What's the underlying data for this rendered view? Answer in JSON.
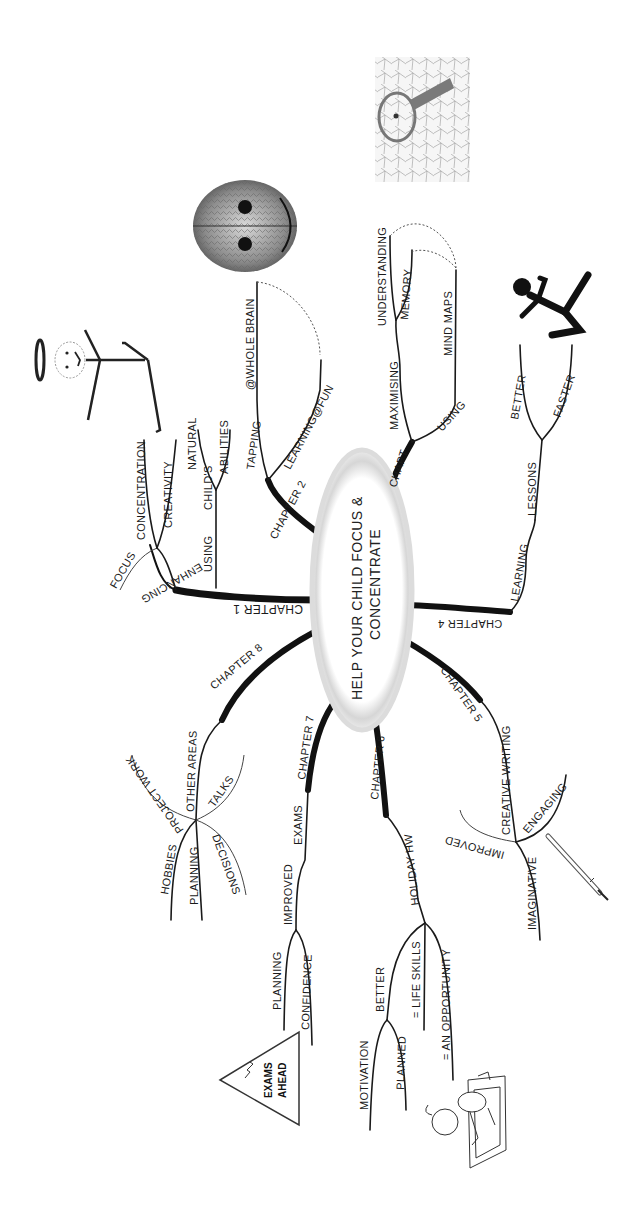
{
  "title": "HELP YOUR CHILD FOCUS & CONCENTRATE",
  "center": {
    "line1": "HELP YOUR CHILD FOCUS &",
    "line2": "CONCENTRATE"
  },
  "orientation": "rotated 90° counter-clockwise",
  "branches": {
    "chapter1": {
      "label": "CHAPTER 1",
      "enhancing": "ENHANCING",
      "focus": "FOCUS",
      "concentration": "CONCENTRATION",
      "creativity": "CREATIVITY",
      "using": "USING",
      "childs": "CHILD'S",
      "natural": "NATURAL",
      "abilities": "ABILITIES"
    },
    "chapter2": {
      "label": "CHAPTER 2",
      "tapping": "TAPPING",
      "whole_brain": "@WHOLE BRAIN",
      "learning_fun": "LEARNING@FUN"
    },
    "chapter3": {
      "label": "CHAPT",
      "maximising": "MAXIMISING",
      "understanding": "UNDERSTANDING",
      "memory": "MEMORY",
      "using": "USING",
      "mind_maps": "MIND MAPS"
    },
    "chapter4": {
      "label": "CHAPTER 4",
      "learning": "LEARNING",
      "lessons": "LESSONS",
      "better": "BETTER",
      "faster": "FASTER"
    },
    "chapter5": {
      "label": "CHAPTER 5",
      "creative_writing": "CREATIVE WRITING",
      "improved": "IMPROVED",
      "engaging": "ENGAGING",
      "imaginative": "IMAGINATIVE"
    },
    "chapter6": {
      "label": "CHAPTER 6",
      "holiday_hw": "HOLIDAY HW",
      "better": "BETTER",
      "motivation": "MOTIVATION",
      "planned": "PLANNED",
      "life_skills": "= LIFE SKILLS",
      "opportunity": "= AN OPPORTUNITY"
    },
    "chapter7": {
      "label": "CHAPTER 7",
      "exams": "EXAMS",
      "improved": "IMPROVED",
      "planning": "PLANNING",
      "confidence": "CONFIDENCE"
    },
    "chapter8": {
      "label": "CHAPTER 8",
      "other_areas": "OTHER AREAS",
      "project_work": "PROJECT WORK",
      "talks": "TALKS",
      "hobbies": "HOBBIES",
      "planning": "PLANNING",
      "decisions": "DECISIONS"
    }
  },
  "illustrations": {
    "exams_sign_line1": "EXAMS",
    "exams_sign_line2": "AHEAD"
  },
  "colors": {
    "ink": "#111111",
    "center_ring": "#cfcfcf",
    "background": "#ffffff"
  }
}
